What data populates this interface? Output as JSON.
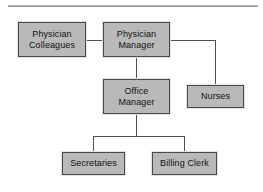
{
  "diagram": {
    "type": "organizational-chart",
    "colors": {
      "node_fill": "#b9b9b9",
      "node_border": "#4a4a4a",
      "connector": "#4f4f4f",
      "rule": "#9a9a9a",
      "background": "#ffffff",
      "text": "#111111"
    },
    "nodes": [
      {
        "id": "physician-colleagues",
        "line1": "Physician",
        "line2": "Colleagues",
        "level": 0
      },
      {
        "id": "physician-manager",
        "line1": "Physician",
        "line2": "Manager",
        "level": 0
      },
      {
        "id": "nurses",
        "line1": "Nurses",
        "line2": "",
        "level": 1
      },
      {
        "id": "office-manager",
        "line1": "Office",
        "line2": "Manager",
        "level": 1
      },
      {
        "id": "secretaries",
        "line1": "Secretaries",
        "line2": "",
        "level": 2
      },
      {
        "id": "billing-clerk",
        "line1": "Billing Clerk",
        "line2": "",
        "level": 2
      }
    ],
    "edges": [
      {
        "from": "physician-colleagues",
        "to": "physician-manager",
        "style": "horizontal"
      },
      {
        "from": "physician-manager",
        "to": "nurses",
        "style": "elbow-right"
      },
      {
        "from": "physician-manager",
        "to": "office-manager",
        "style": "vertical"
      },
      {
        "from": "office-manager",
        "to": "secretaries",
        "style": "bus-down"
      },
      {
        "from": "office-manager",
        "to": "billing-clerk",
        "style": "bus-down"
      }
    ]
  }
}
